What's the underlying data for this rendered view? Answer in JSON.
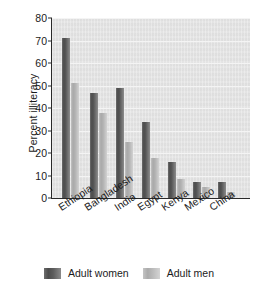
{
  "chart_data": {
    "type": "bar",
    "title": "",
    "xlabel": "",
    "ylabel": "Percent illiteracy",
    "ylim": [
      0,
      80
    ],
    "yticks": [
      0,
      10,
      20,
      30,
      40,
      50,
      60,
      70,
      80
    ],
    "grid": true,
    "legend_position": "bottom",
    "categories": [
      "Ethiopia",
      "Bangladesh",
      "India",
      "Egypt",
      "Kenya",
      "Mexico",
      "China"
    ],
    "series": [
      {
        "name": "Adult women",
        "color": "#555555",
        "values": [
          71,
          46.5,
          49,
          34,
          16,
          7,
          7
        ]
      },
      {
        "name": "Adult men",
        "color": "#b5b5b5",
        "values": [
          51,
          38,
          25,
          18,
          8.5,
          5,
          2.5
        ]
      }
    ]
  },
  "axes": {
    "y_title": "Percent illiteracy",
    "tick_labels": [
      "0",
      "10",
      "20",
      "30",
      "40",
      "50",
      "60",
      "70",
      "80"
    ]
  },
  "legend": {
    "items": [
      {
        "label": "Adult women",
        "swatch": "women"
      },
      {
        "label": "Adult men",
        "swatch": "men"
      }
    ]
  },
  "colors": {
    "plot_background": "#e4e4e4",
    "axis": "#2a2a2a",
    "text": "#1b1b1b",
    "women_bar": "#555555",
    "men_bar": "#b5b5b5"
  }
}
